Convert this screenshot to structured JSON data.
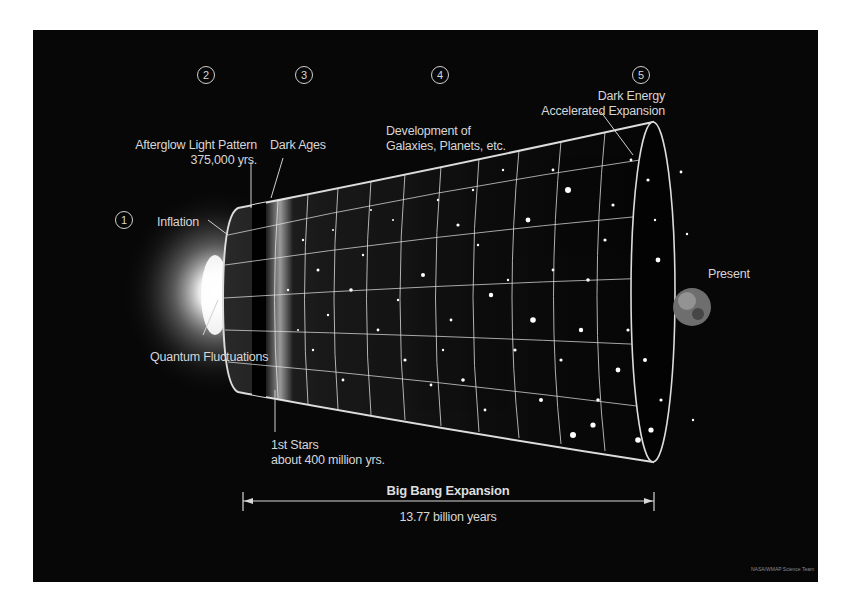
{
  "diagram": {
    "stages": [
      {
        "number": "1",
        "label": "Inflation",
        "sublabel": "Quantum Fluctuations"
      },
      {
        "number": "2",
        "label": "Afterglow Light Pattern",
        "sublabel": "375,000 yrs."
      },
      {
        "number": "3",
        "label": "Dark Ages",
        "sublabel": ""
      },
      {
        "number": "4",
        "label": "Development of",
        "sublabel": "Galaxies, Planets, etc."
      },
      {
        "number": "5",
        "label": "Dark Energy",
        "sublabel": "Accelerated Expansion"
      }
    ],
    "annotations": {
      "first_stars_line1": "1st Stars",
      "first_stars_line2": "about 400 million yrs.",
      "present": "Present"
    },
    "scale_bar": {
      "title": "Big Bang Expansion",
      "duration": "13.77 billion years"
    },
    "credit": "NASA/WMAP Science Team",
    "colors": {
      "background": "#070707",
      "page": "#ffffff",
      "text": "#d6d6d6",
      "grid": "#e8e8e8"
    }
  }
}
